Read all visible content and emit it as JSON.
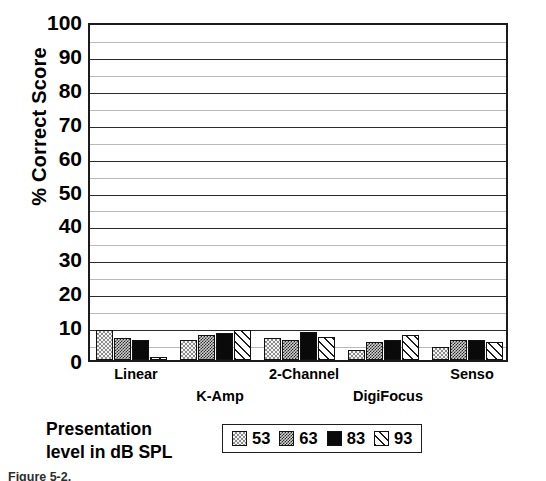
{
  "chart_data": {
    "type": "bar",
    "title": "",
    "xlabel": "",
    "ylabel": "% Correct Score",
    "ylim": [
      0,
      100
    ],
    "ytick_step": 10,
    "minor_gridline_step": 5,
    "grid": true,
    "legend_position": "bottom-center",
    "legend_title": "Presentation level in dB SPL",
    "categories": [
      "Linear",
      "K-Amp",
      "2-Channel",
      "DigiFocus",
      "Senso"
    ],
    "yticks": [
      "100",
      "90",
      "80",
      "70",
      "60",
      "50",
      "40",
      "30",
      "20",
      "10",
      "0"
    ],
    "series": [
      {
        "name": "53",
        "pattern": "light-checker",
        "values": [
          9,
          6,
          6.5,
          3,
          4
        ]
      },
      {
        "name": "63",
        "pattern": "dark-checker",
        "values": [
          6.5,
          7.5,
          6,
          5.5,
          6
        ]
      },
      {
        "name": "83",
        "pattern": "solid-black",
        "values": [
          6,
          8,
          8.5,
          6,
          6
        ]
      },
      {
        "name": "93",
        "pattern": "diagonal-hatch",
        "values": [
          1,
          9,
          7,
          7.5,
          5.5
        ]
      }
    ]
  },
  "axis": {
    "y_title": "% Correct Score",
    "y_ticks": [
      "100",
      "90",
      "80",
      "70",
      "60",
      "50",
      "40",
      "30",
      "20",
      "10",
      "0"
    ],
    "x_categories": [
      "Linear",
      "K-Amp",
      "2-Channel",
      "DigiFocus",
      "Senso"
    ]
  },
  "legend": {
    "title_line1": "Presentation",
    "title_line2": "level in dB SPL",
    "entries": [
      {
        "label": "53",
        "pattern": "light-checker"
      },
      {
        "label": "63",
        "pattern": "dark-checker"
      },
      {
        "label": "83",
        "pattern": "solid-black"
      },
      {
        "label": "93",
        "pattern": "diagonal-hatch"
      }
    ]
  },
  "caption": {
    "text": "Figure 5-2."
  },
  "colors": {
    "axis": "#1b1b1b",
    "grid_major": "#2a2a2a",
    "grid_minor": "#b9b9b9",
    "bar_solid": "#0a0a0a",
    "background": "#ffffff"
  }
}
